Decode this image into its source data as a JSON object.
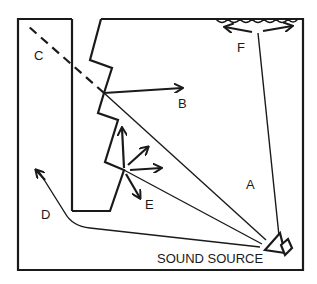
{
  "diagram": {
    "labels": {
      "a": "A",
      "b": "B",
      "c": "C",
      "d": "D",
      "e": "E",
      "f": "F",
      "source": "SOUND SOURCE"
    },
    "icons": {
      "source": "loudspeaker-icon"
    },
    "colors": {
      "ink": "#1a1a1a",
      "background": "#ffffff"
    }
  }
}
